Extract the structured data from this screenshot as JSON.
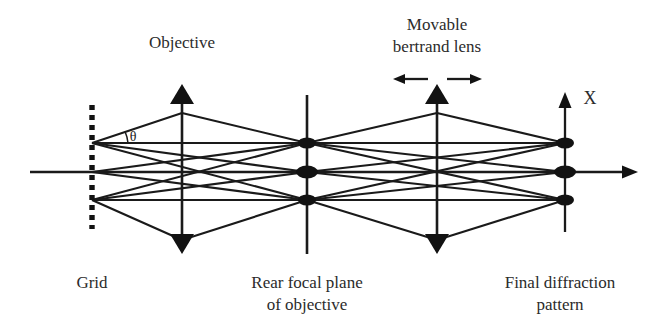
{
  "figure": {
    "type": "optical-ray-diagram",
    "background": "#ffffff",
    "ink_color": "#1a1a1a",
    "width": 664,
    "height": 328
  },
  "labels": {
    "objective": "Objective",
    "movable_line1": "Movable",
    "movable_line2": "bertrand lens",
    "grid": "Grid",
    "rear_focal_line1": "Rear focal plane",
    "rear_focal_line2": "of objective",
    "final_line1": "Final diffraction",
    "final_line2": "pattern",
    "axis_x": "X",
    "angle_theta": "θ"
  },
  "elements": {
    "grid": {
      "name": "Grid",
      "style": "dashed vertical line",
      "x": 92,
      "y_top": 105,
      "y_bottom": 229,
      "source_points_y": [
        143,
        172,
        200
      ]
    },
    "objective": {
      "name": "Objective",
      "style": "double-headed vertical arrow",
      "x": 182,
      "y_top": 88,
      "y_bottom": 250
    },
    "rear_focal_plane": {
      "name": "Rear focal plane of objective",
      "style": "vertical line with three focal spots",
      "x": 307,
      "y_top": 95,
      "y_bottom": 254,
      "spots_y": [
        143,
        172,
        200
      ]
    },
    "bertrand_lens": {
      "name": "Movable bertrand lens",
      "style": "double-headed vertical arrow with movement arrows",
      "x": 437,
      "y_top": 88,
      "y_bottom": 250,
      "movable": true,
      "move_arrows": [
        "left",
        "right"
      ]
    },
    "final_plane": {
      "name": "Final diffraction pattern",
      "style": "vertical X axis with three diffraction spots",
      "x": 565,
      "y_top": 95,
      "y_bottom": 232,
      "spots_y": [
        143,
        172,
        200
      ]
    },
    "optical_axis": {
      "name": "optical axis",
      "y": 172,
      "x_start": 30,
      "x_end": 628,
      "arrowhead": "right"
    }
  }
}
